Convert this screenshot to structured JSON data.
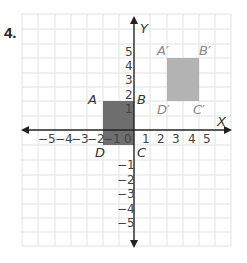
{
  "question": {
    "number": "4."
  },
  "axes": {
    "x_label": "X",
    "y_label": "Y",
    "x_ticks": [
      "−5",
      "−4",
      "−3",
      "−2",
      "−1",
      "0",
      "1",
      "2",
      "3",
      "4",
      "5"
    ],
    "y_ticks_pos": [
      "5",
      "4",
      "3",
      "2",
      "1"
    ],
    "y_ticks_neg": [
      "−1",
      "−2",
      "−3",
      "−4",
      "−5"
    ]
  },
  "shapes": {
    "original": {
      "labels": {
        "A": "A",
        "B": "B",
        "C": "C",
        "D": "D"
      },
      "color": "#6e6e6e"
    },
    "image": {
      "labels": {
        "A": "A′",
        "B": "B′",
        "C": "C′",
        "D": "D′"
      },
      "color": "#b3b3b3"
    }
  },
  "colors": {
    "grid": "#e2e2e2",
    "axis": "#222222"
  }
}
